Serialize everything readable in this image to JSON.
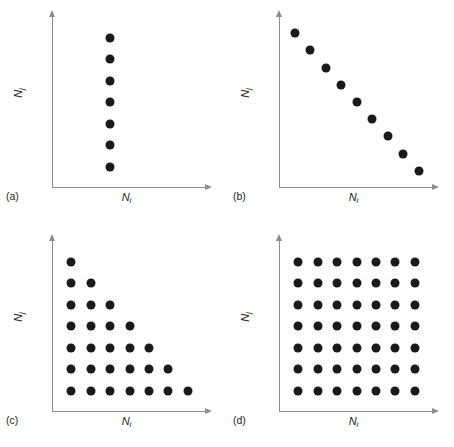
{
  "figure": {
    "axis_label_x": "N",
    "axis_label_x_sub": "i",
    "axis_label_y": "N",
    "axis_label_y_sub": "j",
    "dot_color": "#1a1a1a",
    "axis_color": "#8c8c8c",
    "background": "#ffffff",
    "caption": ""
  },
  "panels": [
    {
      "key": "a",
      "label": "(a)"
    },
    {
      "key": "b",
      "label": "(b)"
    },
    {
      "key": "c",
      "label": "(c)"
    },
    {
      "key": "d",
      "label": "(d)"
    }
  ],
  "chart_data": [
    {
      "type": "scatter",
      "panel": "(a)",
      "title": "",
      "xlabel": "N_i",
      "ylabel": "N_j",
      "xlim": [
        0,
        8
      ],
      "ylim": [
        0,
        8
      ],
      "grid": false,
      "legend": "none",
      "description": "Single vertical column of points at constant N_i",
      "points": [
        [
          3,
          1
        ],
        [
          3,
          2
        ],
        [
          3,
          3
        ],
        [
          3,
          4
        ],
        [
          3,
          5
        ],
        [
          3,
          6
        ],
        [
          3,
          7
        ]
      ]
    },
    {
      "type": "scatter",
      "panel": "(b)",
      "title": "",
      "xlabel": "N_i",
      "ylabel": "N_j",
      "xlim": [
        0,
        10
      ],
      "ylim": [
        0,
        10
      ],
      "grid": false,
      "legend": "none",
      "description": "Descending diagonal: N_i + N_j constant",
      "points": [
        [
          1,
          9
        ],
        [
          2,
          8
        ],
        [
          3,
          7
        ],
        [
          4,
          6
        ],
        [
          5,
          5
        ],
        [
          6,
          4
        ],
        [
          7,
          3
        ],
        [
          8,
          2
        ],
        [
          9,
          1
        ]
      ]
    },
    {
      "type": "scatter",
      "panel": "(c)",
      "title": "",
      "xlabel": "N_i",
      "ylabel": "N_j",
      "xlim": [
        0,
        8
      ],
      "ylim": [
        0,
        8
      ],
      "grid": false,
      "legend": "none",
      "description": "Lower-left triangular staircase: N_i + N_j <= 8",
      "points": [
        [
          1,
          7
        ],
        [
          1,
          6
        ],
        [
          2,
          6
        ],
        [
          1,
          5
        ],
        [
          2,
          5
        ],
        [
          3,
          5
        ],
        [
          1,
          4
        ],
        [
          2,
          4
        ],
        [
          3,
          4
        ],
        [
          4,
          4
        ],
        [
          1,
          3
        ],
        [
          2,
          3
        ],
        [
          3,
          3
        ],
        [
          4,
          3
        ],
        [
          5,
          3
        ],
        [
          1,
          2
        ],
        [
          2,
          2
        ],
        [
          3,
          2
        ],
        [
          4,
          2
        ],
        [
          5,
          2
        ],
        [
          6,
          2
        ],
        [
          1,
          1
        ],
        [
          2,
          1
        ],
        [
          3,
          1
        ],
        [
          4,
          1
        ],
        [
          5,
          1
        ],
        [
          6,
          1
        ],
        [
          7,
          1
        ]
      ]
    },
    {
      "type": "scatter",
      "panel": "(d)",
      "title": "",
      "xlabel": "N_i",
      "ylabel": "N_j",
      "xlim": [
        0,
        8
      ],
      "ylim": [
        0,
        8
      ],
      "grid": false,
      "legend": "none",
      "description": "Full 7 by 7 rectangular lattice of points",
      "points": [
        [
          1,
          7
        ],
        [
          2,
          7
        ],
        [
          3,
          7
        ],
        [
          4,
          7
        ],
        [
          5,
          7
        ],
        [
          6,
          7
        ],
        [
          7,
          7
        ],
        [
          1,
          6
        ],
        [
          2,
          6
        ],
        [
          3,
          6
        ],
        [
          4,
          6
        ],
        [
          5,
          6
        ],
        [
          6,
          6
        ],
        [
          7,
          6
        ],
        [
          1,
          5
        ],
        [
          2,
          5
        ],
        [
          3,
          5
        ],
        [
          4,
          5
        ],
        [
          5,
          5
        ],
        [
          6,
          5
        ],
        [
          7,
          5
        ],
        [
          1,
          4
        ],
        [
          2,
          4
        ],
        [
          3,
          4
        ],
        [
          4,
          4
        ],
        [
          5,
          4
        ],
        [
          6,
          4
        ],
        [
          7,
          4
        ],
        [
          1,
          3
        ],
        [
          2,
          3
        ],
        [
          3,
          3
        ],
        [
          4,
          3
        ],
        [
          5,
          3
        ],
        [
          6,
          3
        ],
        [
          7,
          3
        ],
        [
          1,
          2
        ],
        [
          2,
          2
        ],
        [
          3,
          2
        ],
        [
          4,
          2
        ],
        [
          5,
          2
        ],
        [
          6,
          2
        ],
        [
          7,
          2
        ],
        [
          1,
          1
        ],
        [
          2,
          1
        ],
        [
          3,
          1
        ],
        [
          4,
          1
        ],
        [
          5,
          1
        ],
        [
          6,
          1
        ],
        [
          7,
          1
        ]
      ]
    }
  ]
}
